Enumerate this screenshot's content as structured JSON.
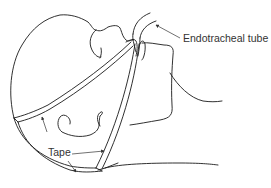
{
  "figure": {
    "labels": {
      "endotracheal_tube": "Endotracheal tube",
      "tape": "Tape"
    },
    "colors": {
      "line": "#1a1a1a",
      "label_text": "#333333",
      "background": "#ffffff"
    }
  }
}
